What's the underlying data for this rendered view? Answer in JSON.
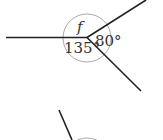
{
  "diagram": {
    "type": "angles-around-a-point",
    "labels": {
      "unknown": "f",
      "angle_a": "135°",
      "angle_b": "80°"
    },
    "colors": {
      "line": "#222222",
      "circle": "#aaaaaa",
      "text": "#333333",
      "background": "#ffffff"
    }
  }
}
